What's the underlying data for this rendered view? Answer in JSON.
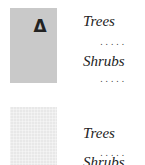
{
  "legend": {
    "entries": [
      {
        "symbol": "Δ",
        "swatch_color": "#c9c9c9",
        "labels": [
          "Trees",
          "Shrubs"
        ],
        "leader": "....."
      },
      {
        "symbol": "",
        "swatch_color": "#e8e8e8",
        "labels": [
          "Trees",
          "Shrubs"
        ],
        "leader": "....."
      }
    ]
  }
}
